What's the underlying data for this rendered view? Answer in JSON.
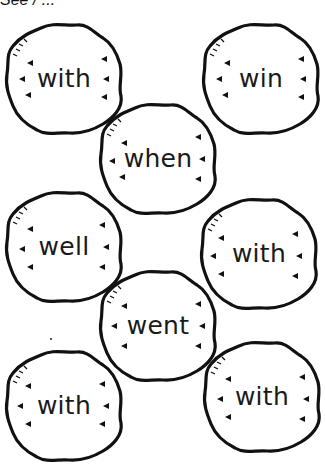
{
  "header": {
    "partial_text": "See / ..."
  },
  "worksheet": {
    "cookies": [
      {
        "word": "with",
        "x": 3,
        "y": 20
      },
      {
        "word": "win",
        "x": 200,
        "y": 20
      },
      {
        "word": "when",
        "x": 97,
        "y": 100
      },
      {
        "word": "well",
        "x": 3,
        "y": 188
      },
      {
        "word": "with",
        "x": 198,
        "y": 195
      },
      {
        "word": "went",
        "x": 97,
        "y": 267
      },
      {
        "word": "with",
        "x": 3,
        "y": 347
      },
      {
        "word": "with",
        "x": 201,
        "y": 338
      }
    ]
  },
  "colors": {
    "ink": "#111111",
    "background": "#ffffff"
  }
}
